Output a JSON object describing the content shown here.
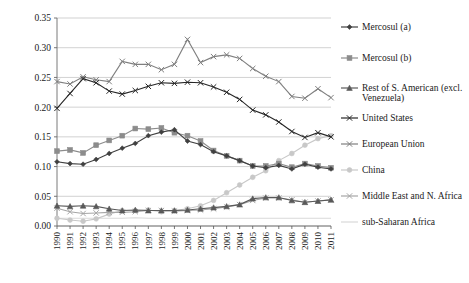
{
  "chart_data": {
    "type": "line",
    "title": "",
    "subtitle": "",
    "xlabel": "",
    "ylabel": "",
    "grid": "horizontal",
    "legend_position": "right",
    "xlim": [
      1990,
      2011
    ],
    "ylim": [
      0.0,
      0.35
    ],
    "ytick_labels": [
      "0.00",
      "0.05",
      "0.10",
      "0.15",
      "0.20",
      "0.25",
      "0.30",
      "0.35"
    ],
    "ytick_values": [
      0.0,
      0.05,
      0.1,
      0.15,
      0.2,
      0.25,
      0.3,
      0.35
    ],
    "x": [
      1990,
      1991,
      1992,
      1993,
      1994,
      1995,
      1996,
      1997,
      1998,
      1999,
      2000,
      2001,
      2002,
      2003,
      2004,
      2005,
      2006,
      2007,
      2008,
      2009,
      2010,
      2011
    ],
    "categories": [
      "1990",
      "1991",
      "1992",
      "1993",
      "1994",
      "1995",
      "1996",
      "1997",
      "1998",
      "1999",
      "2000",
      "2001",
      "2002",
      "2003",
      "2004",
      "2005",
      "2006",
      "2007",
      "2008",
      "2009",
      "2010",
      "2011"
    ],
    "series": [
      {
        "name": "Mercosul (a)",
        "color": "#404040",
        "marker": "diamond",
        "values": [
          0.108,
          0.105,
          0.104,
          0.112,
          0.122,
          0.131,
          0.139,
          0.152,
          0.158,
          0.162,
          0.143,
          0.137,
          0.125,
          0.118,
          0.11,
          0.101,
          0.098,
          0.102,
          0.096,
          0.104,
          0.099,
          0.096
        ]
      },
      {
        "name": "Mercosul (b)",
        "color": "#8c8c8c",
        "marker": "square",
        "values": [
          0.126,
          0.128,
          0.123,
          0.136,
          0.144,
          0.152,
          0.164,
          0.163,
          0.165,
          0.157,
          0.152,
          0.143,
          0.127,
          0.118,
          0.11,
          0.101,
          0.101,
          0.105,
          0.099,
          0.105,
          0.101,
          0.098
        ]
      },
      {
        "name": "Rest of S. American (excl. Venezuela)",
        "color": "#595959",
        "marker": "triangle",
        "values": [
          0.034,
          0.033,
          0.034,
          0.033,
          0.029,
          0.026,
          0.027,
          0.026,
          0.026,
          0.026,
          0.027,
          0.029,
          0.031,
          0.033,
          0.036,
          0.046,
          0.048,
          0.048,
          0.043,
          0.04,
          0.042,
          0.044
        ]
      },
      {
        "name": "United States",
        "color": "#262626",
        "marker": "cross",
        "values": [
          0.198,
          0.223,
          0.248,
          0.241,
          0.227,
          0.222,
          0.228,
          0.235,
          0.241,
          0.24,
          0.242,
          0.241,
          0.234,
          0.225,
          0.213,
          0.195,
          0.187,
          0.175,
          0.159,
          0.149,
          0.157,
          0.15
        ]
      },
      {
        "name": "European Union",
        "color": "#7f7f7f",
        "marker": "cross",
        "values": [
          0.243,
          0.239,
          0.251,
          0.246,
          0.243,
          0.277,
          0.272,
          0.272,
          0.263,
          0.272,
          0.314,
          0.275,
          0.285,
          0.288,
          0.282,
          0.265,
          0.252,
          0.243,
          0.218,
          0.215,
          0.231,
          0.216
        ]
      },
      {
        "name": "China",
        "color": "#c8c8c8",
        "marker": "circle",
        "values": [
          0.013,
          0.01,
          0.008,
          0.012,
          0.02,
          0.026,
          0.026,
          0.027,
          0.024,
          0.026,
          0.029,
          0.034,
          0.043,
          0.056,
          0.069,
          0.082,
          0.093,
          0.11,
          0.122,
          0.136,
          0.147,
          0.152
        ]
      },
      {
        "name": "Middle East and N. Africa",
        "color": "#a6a6a6",
        "marker": "cross",
        "values": [
          0.03,
          0.024,
          0.021,
          0.022,
          0.023,
          0.023,
          0.024,
          0.026,
          0.026,
          0.025,
          0.026,
          0.027,
          0.029,
          0.032,
          0.036,
          0.043,
          0.047,
          0.047,
          0.044,
          0.04,
          0.042,
          0.044
        ]
      },
      {
        "name": "sub-Saharan Africa",
        "color": "#d9d9d9",
        "marker": "none",
        "values": [
          0.013,
          0.013,
          0.013,
          0.013,
          0.013,
          0.013,
          0.014,
          0.013,
          0.013,
          0.013,
          0.013,
          0.013,
          0.013,
          0.013,
          0.013,
          0.013,
          0.013,
          0.013,
          0.013,
          0.013,
          0.013,
          0.013
        ]
      }
    ]
  },
  "legend": {
    "items": [
      {
        "label": "Mercosul (a)"
      },
      {
        "label": "Mercosul (b)"
      },
      {
        "label": "Rest of S. American (excl.",
        "label2": "Venezuela)"
      },
      {
        "label": "United States"
      },
      {
        "label": "European Union"
      },
      {
        "label": "China"
      },
      {
        "label": "Middle East and N. Africa"
      },
      {
        "label": "sub-Saharan Africa"
      }
    ]
  }
}
